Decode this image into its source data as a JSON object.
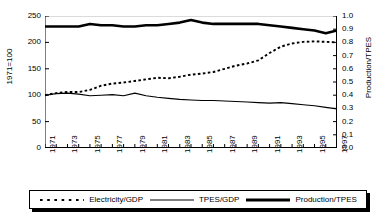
{
  "chart_data": {
    "type": "line",
    "title": "",
    "xlabel": "",
    "ylabel": "1971=100",
    "ylabel_right": "Production/TPES",
    "xlim": [
      1971,
      1997
    ],
    "ylim": [
      0,
      250
    ],
    "ylim_right": [
      0.0,
      1.0
    ],
    "grid": false,
    "legend_position": "bottom",
    "x": [
      1971,
      1972,
      1973,
      1974,
      1975,
      1976,
      1977,
      1978,
      1979,
      1980,
      1981,
      1982,
      1983,
      1984,
      1985,
      1986,
      1987,
      1988,
      1989,
      1990,
      1991,
      1992,
      1993,
      1994,
      1995,
      1996,
      1997
    ],
    "y_ticks": [
      0,
      50,
      100,
      150,
      200,
      250
    ],
    "y_ticks_right": [
      0.0,
      0.1,
      0.2,
      0.3,
      0.4,
      0.5,
      0.6,
      0.7,
      0.8,
      0.9,
      1.0
    ],
    "x_tick_labels": [
      "1971",
      "1973",
      "1975",
      "1977",
      "1979",
      "1981",
      "1983",
      "1985",
      "1987",
      "1989",
      "1991",
      "1993",
      "1995",
      "1997"
    ],
    "series": [
      {
        "name": "Electricity/GDP",
        "style": "dotted",
        "axis": "left",
        "values": [
          100,
          104,
          106,
          106,
          110,
          118,
          122,
          124,
          127,
          130,
          133,
          132,
          135,
          139,
          141,
          144,
          150,
          156,
          160,
          166,
          180,
          192,
          198,
          201,
          202,
          201,
          200
        ]
      },
      {
        "name": "TPES/GDP",
        "style": "thin-solid",
        "axis": "left",
        "values": [
          100,
          103,
          104,
          102,
          99,
          100,
          101,
          99,
          104,
          99,
          96,
          94,
          92,
          91,
          90,
          90,
          89,
          88,
          87,
          86,
          85,
          86,
          84,
          82,
          80,
          77,
          74
        ]
      },
      {
        "name": "Production/TPES",
        "style": "thick-solid",
        "axis": "right",
        "values": [
          0.92,
          0.92,
          0.92,
          0.92,
          0.94,
          0.93,
          0.93,
          0.92,
          0.92,
          0.93,
          0.93,
          0.94,
          0.95,
          0.97,
          0.95,
          0.94,
          0.94,
          0.94,
          0.94,
          0.94,
          0.93,
          0.92,
          0.91,
          0.9,
          0.89,
          0.87,
          0.89
        ]
      }
    ]
  },
  "legend": {
    "items": [
      {
        "label": "Electricity/GDP"
      },
      {
        "label": "TPES/GDP"
      },
      {
        "label": "Production/TPES"
      }
    ]
  },
  "colors": {
    "line": "#000000",
    "background": "#ffffff",
    "axis": "#000000"
  }
}
